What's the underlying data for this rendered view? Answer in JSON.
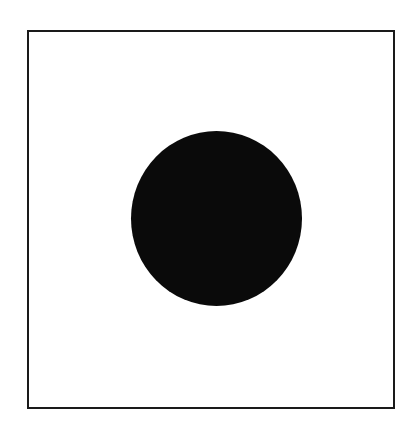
{
  "diagram": {
    "frame": {
      "shape": "square-outline",
      "stroke": "#1a1a1a",
      "fill": "#ffffff"
    },
    "disc": {
      "shape": "filled-circle",
      "fill": "#0a0a0a"
    }
  }
}
